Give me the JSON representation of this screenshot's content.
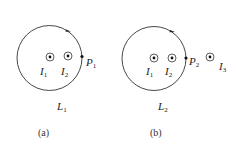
{
  "figures": [
    {
      "id": "a",
      "caption": "(a)",
      "loop_label": {
        "main": "L",
        "sub": "1"
      },
      "point_label": {
        "main": "P",
        "sub": "1"
      },
      "currents": [
        {
          "main": "I",
          "sub": "1"
        },
        {
          "main": "I",
          "sub": "2"
        }
      ]
    },
    {
      "id": "b",
      "caption": "(b)",
      "loop_label": {
        "main": "L",
        "sub": "2"
      },
      "point_label": {
        "main": "P",
        "sub": "2"
      },
      "currents": [
        {
          "main": "I",
          "sub": "1"
        },
        {
          "main": "I",
          "sub": "2"
        },
        {
          "main": "I",
          "sub": "3"
        }
      ]
    }
  ],
  "colors": {
    "stroke": "#333333",
    "text": "#222222"
  }
}
